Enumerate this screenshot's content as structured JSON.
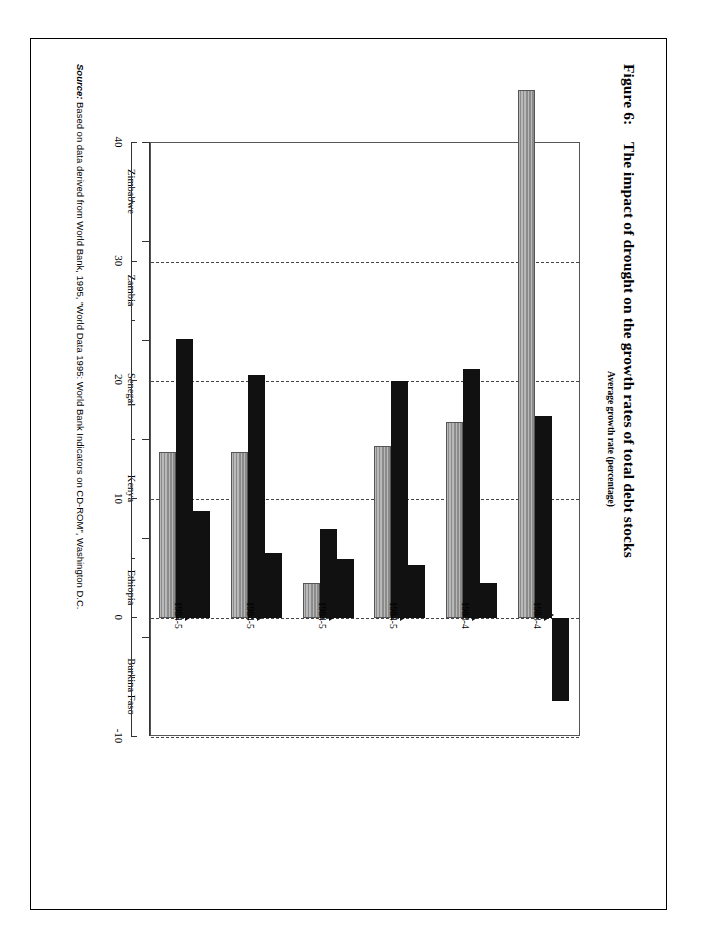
{
  "figure": {
    "number_label": "Figure 6:",
    "title": "The impact of drought on the growth rates of total debt stocks"
  },
  "source": {
    "label": "Source:",
    "text": "Based on data derived from World Bank, 1995, \"World Data 1995: World Bank Indicators on CD-ROM\", Washington D.C."
  },
  "legend": {
    "items": [
      {
        "label": "2 pre-drought years",
        "swatch": "light-hatched"
      },
      {
        "label": "Drought and post-drought year",
        "swatch": "black"
      },
      {
        "label": "2nd and 3rd post-drought years",
        "swatch": "black"
      }
    ]
  },
  "chart_data": {
    "type": "bar",
    "orientation": "horizontal",
    "title": "The impact of drought on the growth rates of total debt stocks",
    "xlabel": "",
    "ylabel": "Average growth rate (percentage)",
    "ylim": [
      -10,
      40
    ],
    "yticks": [
      40,
      30,
      20,
      10,
      0,
      -10
    ],
    "ytick_labels": [
      "40",
      "30",
      "20",
      "10",
      "0",
      "-10"
    ],
    "minor_ticks": [
      35,
      25,
      15,
      5,
      -5
    ],
    "grid": true,
    "grid_style": "dashed",
    "legend_position": "right",
    "categories": [
      "Burkina Faso",
      "Ethiopia",
      "Kenya",
      "Senegal",
      "Zambia",
      "Zimbabwe"
    ],
    "annotations": [
      "1984-5",
      "1984-5",
      "1984-5",
      "1984-5",
      "1983-4",
      "1983-4"
    ],
    "series": [
      {
        "name": "2 pre-drought years",
        "color": "#a0a0a0",
        "values": [
          14.0,
          14.0,
          3.0,
          14.5,
          16.5,
          44.5
        ]
      },
      {
        "name": "Drought and post-drought year",
        "color": "#111111",
        "values": [
          23.5,
          20.5,
          7.5,
          20.0,
          21.0,
          17.0
        ]
      },
      {
        "name": "2nd and 3rd post-drought years",
        "color": "#111111",
        "values": [
          9.0,
          5.5,
          5.0,
          4.5,
          3.0,
          -7.0
        ]
      }
    ]
  }
}
